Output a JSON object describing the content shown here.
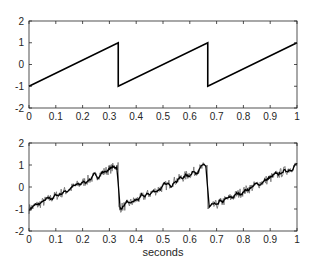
{
  "chart_data": [
    {
      "type": "line",
      "title": "",
      "xlabel": "",
      "ylabel": "",
      "xlim": [
        0,
        1
      ],
      "ylim": [
        -2,
        2
      ],
      "xticks": [
        "0",
        "0.1",
        "0.2",
        "0.3",
        "0.4",
        "0.5",
        "0.6",
        "0.7",
        "0.8",
        "0.9",
        "1"
      ],
      "yticks": [
        "-2",
        "-1",
        "0",
        "1",
        "2"
      ],
      "grid": false,
      "series": [
        {
          "name": "sawtooth",
          "color": "#000000",
          "x": [
            0,
            0.333,
            0.333,
            0.667,
            0.667,
            1.0
          ],
          "y": [
            -1,
            1,
            -1,
            1,
            -1,
            1
          ]
        }
      ]
    },
    {
      "type": "line",
      "title": "",
      "xlabel": "seconds",
      "ylabel": "",
      "xlim": [
        0,
        1
      ],
      "ylim": [
        -2,
        2
      ],
      "xticks": [
        "0",
        "0.1",
        "0.2",
        "0.3",
        "0.4",
        "0.5",
        "0.6",
        "0.7",
        "0.8",
        "0.9",
        "1"
      ],
      "yticks": [
        "-2",
        "-1",
        "0",
        "1",
        "2"
      ],
      "grid": false,
      "series": [
        {
          "name": "noisy sawtooth",
          "color": "#000000",
          "description": "sawtooth from -1 to 1 with period 1/3 s plus additive noise (~±0.2)",
          "x": [
            0,
            0.333,
            0.333,
            0.667,
            0.667,
            1.0
          ],
          "y": [
            -1,
            1,
            -1,
            1,
            -1,
            1
          ]
        }
      ]
    }
  ],
  "plots": {
    "top": {
      "xticks": [
        "0",
        "0.1",
        "0.2",
        "0.3",
        "0.4",
        "0.5",
        "0.6",
        "0.7",
        "0.8",
        "0.9",
        "1"
      ],
      "yticks": [
        "-2",
        "-1",
        "0",
        "1",
        "2"
      ]
    },
    "bottom": {
      "xticks": [
        "0",
        "0.1",
        "0.2",
        "0.3",
        "0.4",
        "0.5",
        "0.6",
        "0.7",
        "0.8",
        "0.9",
        "1"
      ],
      "yticks": [
        "-2",
        "-1",
        "0",
        "1",
        "2"
      ],
      "xlabel": "seconds"
    }
  }
}
